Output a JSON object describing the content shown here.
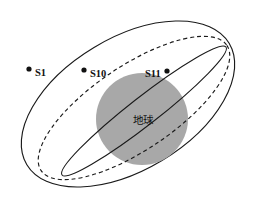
{
  "diagram": {
    "canvas": {
      "width": 258,
      "height": 209,
      "background": "#ffffff"
    },
    "colors": {
      "stroke": "#1a1a1a",
      "earth_fill": "#a8a8a8",
      "dot_fill": "#111111",
      "text": "#111111"
    },
    "center_body": {
      "label": "地球",
      "fill": "#a8a8a8",
      "cx": 142,
      "cy": 119,
      "r": 46,
      "label_x": 143,
      "label_y": 124
    },
    "foci": [
      {
        "name": "node-top-right",
        "x": 238,
        "y": 26
      },
      {
        "name": "node-bottom-left",
        "x": 52,
        "y": 198
      }
    ],
    "orbits": [
      {
        "name": "outer-orbit",
        "style": "solid",
        "rx": 118,
        "ry": 66,
        "cx": 128,
        "cy": 104,
        "rotation": -31
      },
      {
        "name": "middle-orbit",
        "style": "dashed",
        "rx": 112,
        "ry": 42,
        "cx": 134,
        "cy": 108,
        "rotation": -34
      },
      {
        "name": "inner-orbit",
        "style": "solid",
        "rx": 104,
        "ry": 14,
        "cx": 144,
        "cy": 111,
        "rotation": -38
      }
    ],
    "satellites": [
      {
        "id": "S1",
        "label": "S1",
        "dot_x": 29,
        "dot_y": 69,
        "label_x": 35,
        "label_y": 76,
        "orbit": "outer-orbit"
      },
      {
        "id": "S10",
        "label": "S10",
        "dot_x": 84,
        "dot_y": 70,
        "label_x": 90,
        "label_y": 77,
        "orbit": "middle-orbit"
      },
      {
        "id": "S11",
        "label": "S11",
        "dot_x": 167,
        "dot_y": 71,
        "label_x": 145,
        "label_y": 77,
        "orbit": "inner-orbit"
      }
    ]
  }
}
